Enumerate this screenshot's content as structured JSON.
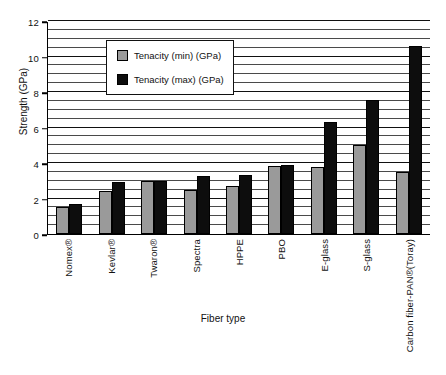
{
  "chart_data": {
    "type": "bar",
    "title": "",
    "xlabel": "Fiber type",
    "ylabel": "Strength (GPa)",
    "ylim": [
      0,
      12
    ],
    "ytick_step": 2,
    "gridline_step": 0.5,
    "grid": true,
    "legend_position": "upper-left-inside",
    "categories": [
      "Nomex®",
      "Kevlar®",
      "Twaron®",
      "Spectra",
      "HPPE",
      "PBO",
      "E-glass",
      "S-glass",
      "Carbon fiber-PAN®(Toray)"
    ],
    "yticks": [
      "0",
      "2",
      "4",
      "6",
      "8",
      "10",
      "12"
    ],
    "series": [
      {
        "name": "Tenacity (min) (GPa)",
        "color": "#9a9a9a",
        "values": [
          1.5,
          2.4,
          3.0,
          2.5,
          2.7,
          3.85,
          3.8,
          5.0,
          3.5
        ]
      },
      {
        "name": "Tenacity (max) (GPa)",
        "color": "#0d0d0d",
        "values": [
          1.7,
          2.95,
          3.0,
          3.25,
          3.35,
          3.9,
          6.3,
          7.55,
          10.6
        ]
      }
    ]
  }
}
